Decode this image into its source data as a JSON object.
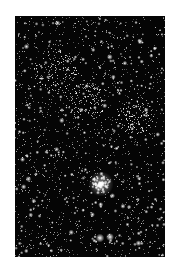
{
  "image": {
    "subject": "star field",
    "description": "Black-and-white astronomical photograph of a dense star field with a bright compact star cluster in the lower half and two bright stars near the bottom",
    "background_color": "#ffffff",
    "sky_color": "#050505",
    "star_color": "#ffffff",
    "frame": {
      "x": 15,
      "y": 16,
      "width": 150,
      "height": 241
    }
  },
  "features": {
    "cluster": {
      "label": "bright compact cluster",
      "x": 86,
      "y": 168,
      "radius": 9
    },
    "bright_stars": [
      {
        "x": 85,
        "y": 222,
        "r": 2.2
      },
      {
        "x": 95,
        "y": 221,
        "r": 2.0
      }
    ],
    "dense_regions": [
      {
        "x": 40,
        "y": 55,
        "radius": 22
      },
      {
        "x": 70,
        "y": 85,
        "radius": 20
      },
      {
        "x": 120,
        "y": 100,
        "radius": 18
      }
    ]
  },
  "render": {
    "seed": 20240611,
    "faint_star_count": 1400,
    "medium_star_count": 260,
    "bright_star_count": 45
  }
}
